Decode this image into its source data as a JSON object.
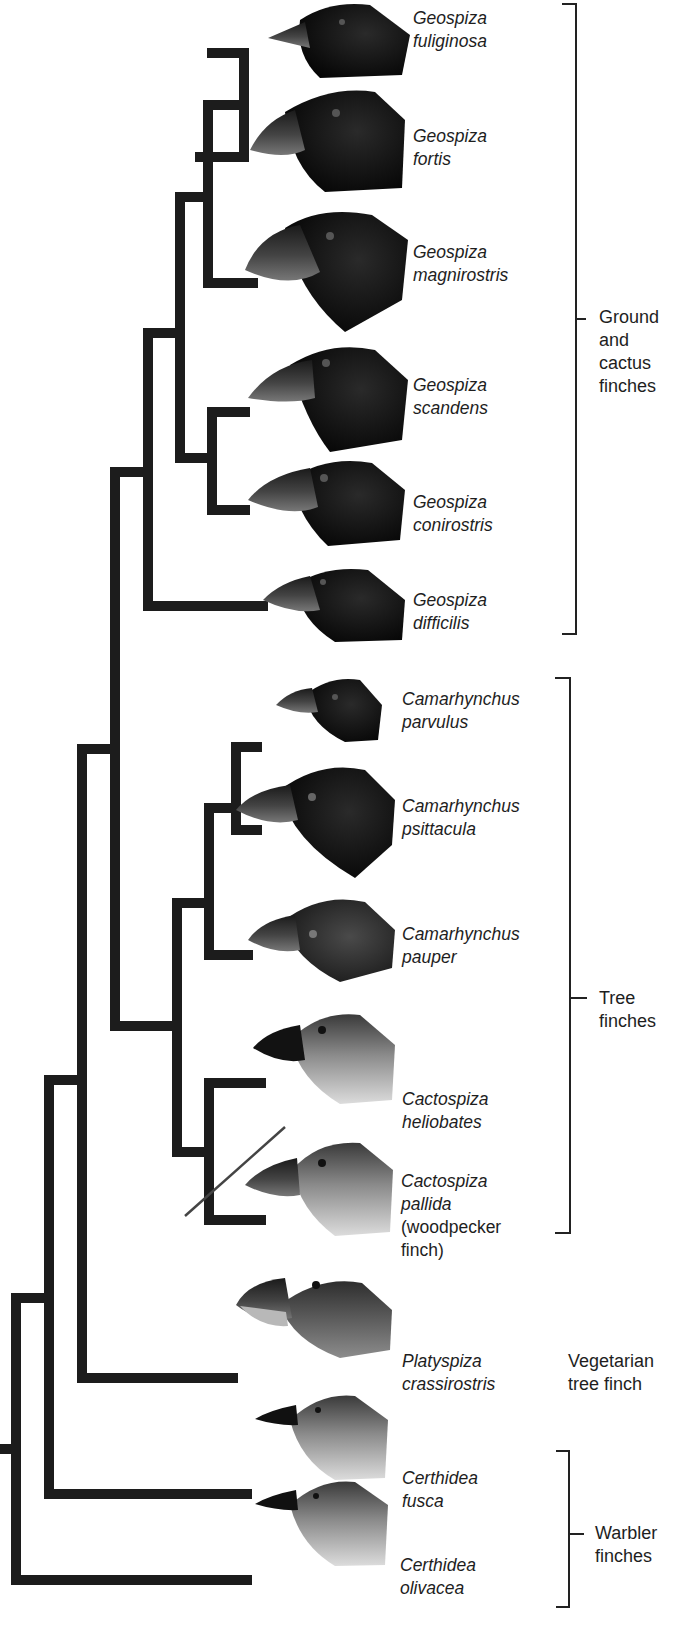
{
  "diagram": {
    "type": "phylogenetic-tree",
    "species": [
      {
        "genus": "Geospiza",
        "epithet": "fuliginosa",
        "tip_y": 53,
        "plumage": "dark"
      },
      {
        "genus": "Geospiza",
        "epithet": "fortis",
        "tip_y": 157,
        "plumage": "dark"
      },
      {
        "genus": "Geospiza",
        "epithet": "magnirostris",
        "tip_y": 283,
        "plumage": "dark"
      },
      {
        "genus": "Geospiza",
        "epithet": "scandens",
        "tip_y": 412,
        "plumage": "dark"
      },
      {
        "genus": "Geospiza",
        "epithet": "conirostris",
        "tip_y": 510,
        "plumage": "dark"
      },
      {
        "genus": "Geospiza",
        "epithet": "difficilis",
        "tip_y": 606,
        "plumage": "dark"
      },
      {
        "genus": "Camarhynchus",
        "epithet": "parvulus",
        "tip_y": 747,
        "plumage": "dark"
      },
      {
        "genus": "Camarhynchus",
        "epithet": "psittacula",
        "tip_y": 830,
        "plumage": "dark"
      },
      {
        "genus": "Camarhynchus",
        "epithet": "pauper",
        "tip_y": 955,
        "plumage": "dark-brown"
      },
      {
        "genus": "Cactospiza",
        "epithet": "heliobates",
        "tip_y": 1083,
        "plumage": "light"
      },
      {
        "genus": "Cactospiza",
        "epithet": "pallida",
        "note1": "(woodpecker",
        "note2": "finch)",
        "tip_y": 1220,
        "plumage": "light"
      },
      {
        "genus": "Platyspiza",
        "epithet": "crassirostris",
        "tip_y": 1378,
        "plumage": "medium"
      },
      {
        "genus": "Certhidea",
        "epithet": "fusca",
        "tip_y": 1494,
        "plumage": "light"
      },
      {
        "genus": "Certhidea",
        "epithet": "olivacea",
        "tip_y": 1580,
        "plumage": "light"
      }
    ],
    "groups": [
      {
        "line1": "Ground",
        "line2": "and",
        "line3": "cactus",
        "line4": "finches"
      },
      {
        "line1": "Tree",
        "line2": "finches"
      },
      {
        "line1": "Vegetarian",
        "line2": "tree finch"
      },
      {
        "line1": "Warbler",
        "line2": "finches"
      }
    ],
    "colors": {
      "branch": "#1c1c1c",
      "bracket": "#222222",
      "text": "#1e1e1e"
    }
  }
}
